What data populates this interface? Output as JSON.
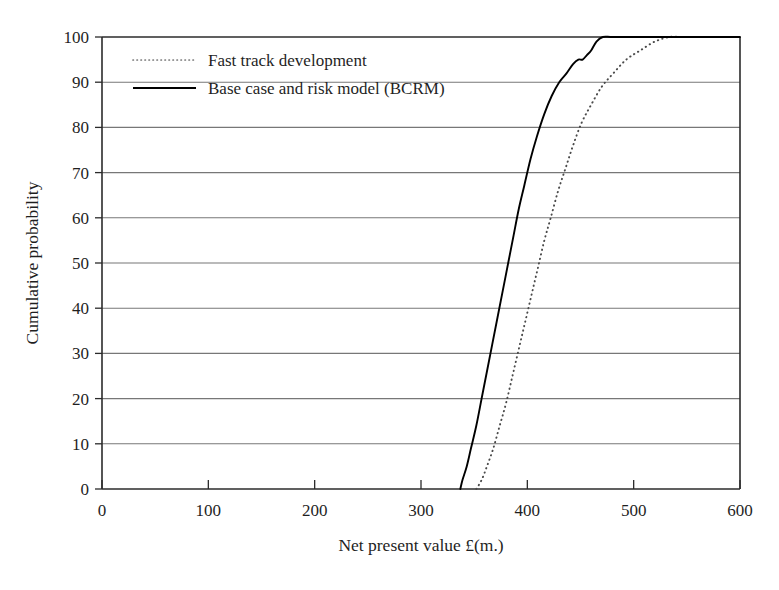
{
  "chart_data": {
    "type": "line",
    "title": "",
    "xlabel": "Net present value £(m.)",
    "ylabel": "Cumulative probability",
    "xlim": [
      0,
      600
    ],
    "ylim": [
      0,
      100
    ],
    "xticks": [
      "0",
      "100",
      "200",
      "300",
      "400",
      "500",
      "600"
    ],
    "yticks": [
      "0",
      "10",
      "20",
      "30",
      "40",
      "50",
      "60",
      "70",
      "80",
      "90",
      "100"
    ],
    "grid": "horizontal",
    "legend_position": "top-left-inside",
    "series": [
      {
        "name": "Fast track development",
        "style": "dotted",
        "color": "#4a4a4a",
        "points": [
          [
            352,
            0
          ],
          [
            357,
            2
          ],
          [
            362,
            5
          ],
          [
            368,
            9
          ],
          [
            374,
            14
          ],
          [
            380,
            19
          ],
          [
            386,
            25
          ],
          [
            392,
            31
          ],
          [
            398,
            37
          ],
          [
            404,
            43
          ],
          [
            410,
            49
          ],
          [
            416,
            55
          ],
          [
            422,
            60
          ],
          [
            429,
            66
          ],
          [
            436,
            71
          ],
          [
            443,
            76
          ],
          [
            451,
            81
          ],
          [
            460,
            85
          ],
          [
            470,
            89
          ],
          [
            481,
            92
          ],
          [
            493,
            95
          ],
          [
            506,
            97
          ],
          [
            520,
            99
          ],
          [
            534,
            100
          ],
          [
            545,
            100
          ]
        ]
      },
      {
        "name": "Base case and risk model (BCRM)",
        "style": "solid",
        "color": "#000000",
        "points": [
          [
            337,
            0
          ],
          [
            339,
            2
          ],
          [
            343,
            5
          ],
          [
            347,
            9
          ],
          [
            352,
            14
          ],
          [
            357,
            20
          ],
          [
            362,
            26
          ],
          [
            367,
            32
          ],
          [
            372,
            38
          ],
          [
            377,
            44
          ],
          [
            382,
            50
          ],
          [
            387,
            56
          ],
          [
            392,
            62
          ],
          [
            397,
            67
          ],
          [
            403,
            73
          ],
          [
            409,
            78
          ],
          [
            416,
            83
          ],
          [
            423,
            87
          ],
          [
            430,
            90
          ],
          [
            437,
            92
          ],
          [
            443,
            94
          ],
          [
            448,
            95
          ],
          [
            452,
            95
          ],
          [
            456,
            96
          ],
          [
            460,
            97
          ],
          [
            465,
            99
          ],
          [
            471,
            100
          ],
          [
            480,
            100
          ],
          [
            500,
            100
          ],
          [
            540,
            100
          ],
          [
            600,
            100
          ]
        ]
      }
    ],
    "legend": [
      {
        "label": "Fast track development",
        "style": "dotted"
      },
      {
        "label": "Base case and risk model (BCRM)",
        "style": "solid"
      }
    ]
  }
}
